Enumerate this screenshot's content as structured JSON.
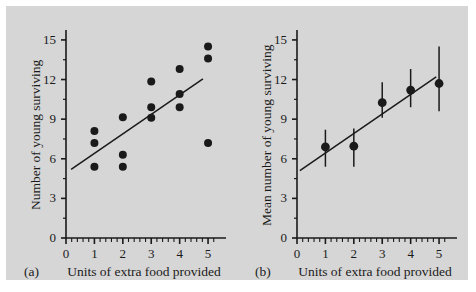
{
  "figure": {
    "background_color": "#d6d6d6",
    "page_color": "#ffffff",
    "ink_color": "#1a1a1a"
  },
  "chart_data": [
    {
      "panel_letter": "(a)",
      "type": "scatter",
      "title": "",
      "xlabel": "Units of extra food provided",
      "ylabel": "Number of young surviving",
      "xlim": [
        0,
        5.35
      ],
      "ylim": [
        0,
        15.6
      ],
      "xticks": [
        0,
        1,
        2,
        3,
        4,
        5
      ],
      "xtick_labels": [
        "0",
        "1",
        "2",
        "3",
        "4",
        "5"
      ],
      "yticks": [
        0,
        3,
        6,
        9,
        12,
        15
      ],
      "ytick_labels": [
        "0",
        "3",
        "6",
        "9",
        "12",
        "15"
      ],
      "x_minor_ticks_per_unit": 5,
      "y_minor_ticks_per_unit": 2,
      "grid": false,
      "legend": "none",
      "marker": "filled-circle",
      "points": [
        {
          "x": 1,
          "y": 8.1
        },
        {
          "x": 1,
          "y": 7.2
        },
        {
          "x": 1,
          "y": 5.4
        },
        {
          "x": 2,
          "y": 9.15
        },
        {
          "x": 2,
          "y": 6.3
        },
        {
          "x": 2,
          "y": 5.4
        },
        {
          "x": 3,
          "y": 11.85
        },
        {
          "x": 3,
          "y": 9.9
        },
        {
          "x": 3,
          "y": 9.1
        },
        {
          "x": 4,
          "y": 12.8
        },
        {
          "x": 4,
          "y": 10.9
        },
        {
          "x": 4,
          "y": 9.9
        },
        {
          "x": 5,
          "y": 14.5
        },
        {
          "x": 5,
          "y": 13.6
        },
        {
          "x": 5,
          "y": 7.2
        }
      ],
      "fit_line": {
        "x0": 0.18,
        "y0": 5.2,
        "x1": 4.82,
        "y1": 12.05
      }
    },
    {
      "panel_letter": "(b)",
      "type": "scatter",
      "title": "",
      "xlabel": "Units of extra food provided",
      "ylabel": "Mean number of young surviving",
      "xlim": [
        0,
        5.35
      ],
      "ylim": [
        0,
        15.6
      ],
      "xticks": [
        0,
        1,
        2,
        3,
        4,
        5
      ],
      "xtick_labels": [
        "0",
        "1",
        "2",
        "3",
        "4",
        "5"
      ],
      "yticks": [
        0,
        3,
        6,
        9,
        12,
        15
      ],
      "ytick_labels": [
        "0",
        "3",
        "6",
        "9",
        "12",
        "15"
      ],
      "x_minor_ticks_per_unit": 5,
      "y_minor_ticks_per_unit": 2,
      "grid": false,
      "legend": "none",
      "marker": "filled-circle-with-error-bars",
      "points": [
        {
          "x": 1,
          "y": 6.9,
          "err_low": 5.4,
          "err_high": 8.2
        },
        {
          "x": 2,
          "y": 6.95,
          "err_low": 5.4,
          "err_high": 8.3
        },
        {
          "x": 3,
          "y": 10.25,
          "err_low": 9.1,
          "err_high": 11.8
        },
        {
          "x": 4,
          "y": 11.2,
          "err_low": 9.9,
          "err_high": 12.8
        },
        {
          "x": 5,
          "y": 11.7,
          "err_low": 9.6,
          "err_high": 14.5
        }
      ],
      "fit_line": {
        "x0": 0.1,
        "y0": 5.1,
        "x1": 4.9,
        "y1": 12.2
      }
    }
  ]
}
